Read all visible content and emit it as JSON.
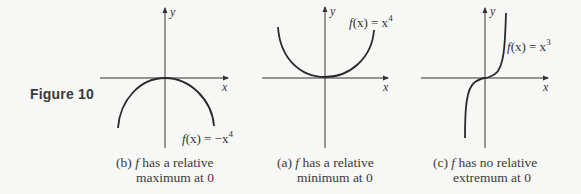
{
  "figure": {
    "label": "Figure 10",
    "panels": [
      {
        "id": "b",
        "function_label": "f(x) = −x⁴",
        "fx_prefix": "f",
        "fx_mid": "(x) = −x",
        "fx_exp": "4",
        "axis_x": "x",
        "axis_y": "y",
        "caption_tag": "(b)",
        "caption_f": "f",
        "caption_line1": " has a relative",
        "caption_line2": "maximum at 0"
      },
      {
        "id": "a",
        "function_label": "f(x) = x⁴",
        "fx_prefix": "f",
        "fx_mid": "(x) = x",
        "fx_exp": "4",
        "axis_x": "x",
        "axis_y": "y",
        "caption_tag": "(a)",
        "caption_f": "f",
        "caption_line1": " has a relative",
        "caption_line2": "minimum at 0"
      },
      {
        "id": "c",
        "function_label": "f(x) = x³",
        "fx_prefix": "f",
        "fx_mid": "(x) = x",
        "fx_exp": "3",
        "axis_x": "x",
        "axis_y": "y",
        "caption_tag": "(c)",
        "caption_f": "f",
        "caption_line1": " has no relative",
        "caption_line2": "extremum at 0"
      }
    ]
  },
  "colors": {
    "background": "#f7f7f5",
    "ink": "#333333",
    "curve": "#2a2a2a"
  }
}
